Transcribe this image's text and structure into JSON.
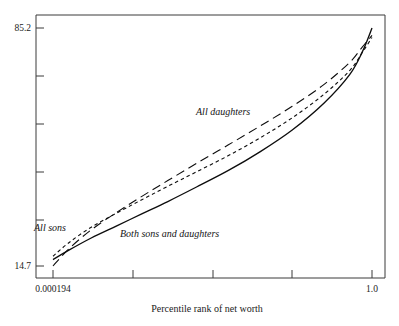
{
  "chart_data": {
    "type": "line",
    "title": "",
    "xlabel": "Percentile rank of net worth",
    "ylabel": "",
    "xlim": [
      0.000194,
      1.0
    ],
    "ylim": [
      14.7,
      85.2
    ],
    "grid": false,
    "legend": "inline-annotations",
    "x_tick_labels": [
      "0.000194",
      "1.0"
    ],
    "y_tick_labels": [
      "85.2",
      "14.7"
    ],
    "x_tick_count": 5,
    "y_tick_count": 6,
    "series": [
      {
        "name": "All daughters",
        "style": "long-dash",
        "label": "All daughters",
        "x": [
          0.000194,
          0.05,
          0.12,
          0.2,
          0.28,
          0.36,
          0.45,
          0.55,
          0.65,
          0.75,
          0.85,
          0.93,
          0.97,
          1.0
        ],
        "y": [
          14.7,
          19.8,
          25.4,
          30.6,
          35.4,
          40.0,
          45.1,
          50.6,
          56.2,
          62.0,
          68.5,
          75.0,
          79.6,
          83.0
        ]
      },
      {
        "name": "All sons",
        "style": "short-dash",
        "label": "All sons",
        "x": [
          0.000194,
          0.05,
          0.12,
          0.2,
          0.28,
          0.36,
          0.45,
          0.55,
          0.65,
          0.75,
          0.85,
          0.93,
          0.97,
          1.0
        ],
        "y": [
          17.6,
          21.6,
          26.2,
          30.4,
          34.4,
          38.3,
          42.6,
          47.4,
          52.7,
          58.6,
          65.6,
          72.6,
          78.0,
          82.4
        ]
      },
      {
        "name": "Both sons and daughters",
        "style": "solid",
        "label": "Both sons and daughters",
        "x": [
          0.000194,
          0.05,
          0.12,
          0.2,
          0.28,
          0.36,
          0.45,
          0.55,
          0.65,
          0.75,
          0.85,
          0.93,
          0.97,
          1.0
        ],
        "y": [
          16.6,
          19.4,
          23.0,
          26.6,
          30.2,
          33.8,
          38.1,
          43.0,
          48.6,
          55.0,
          63.0,
          71.4,
          78.2,
          85.2
        ]
      }
    ],
    "annotations": [
      {
        "text": "All daughters",
        "x_px": 196,
        "y_px": 115
      },
      {
        "text": "All sons",
        "x_px": 34,
        "y_px": 231
      },
      {
        "text": "Both sons and daughters",
        "x_px": 120,
        "y_px": 237
      }
    ],
    "colors": {
      "line": "#0d0d0d",
      "axis": "#3a3a3a",
      "text": "#1b1b1b",
      "background": "#ffffff"
    }
  }
}
